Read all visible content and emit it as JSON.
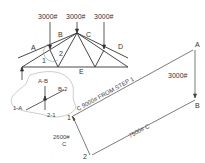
{
  "truss": {
    "loads": [
      {
        "label": "3000#"
      },
      {
        "label": "3000#"
      },
      {
        "label": "3000#"
      }
    ],
    "spaces": {
      "a": "A",
      "b": "B",
      "c": "C",
      "d": "D",
      "e": "E",
      "one": "1",
      "two": "2"
    }
  },
  "joint_detail": {
    "ab": "A-B",
    "b2": "B-2",
    "oneA": "1-A",
    "twoOne": "2-1"
  },
  "force_polygon": {
    "pointA": "A",
    "pointB": "B",
    "point1": "1",
    "point2": "2",
    "ab_force": "3000#",
    "c1_force": "C  9000# FROM STEP 1",
    "b2_force": "7500# C",
    "one2_force": "2600#",
    "one2_type": "C"
  },
  "colors": {
    "line": "#333333",
    "light_line": "#888888"
  }
}
